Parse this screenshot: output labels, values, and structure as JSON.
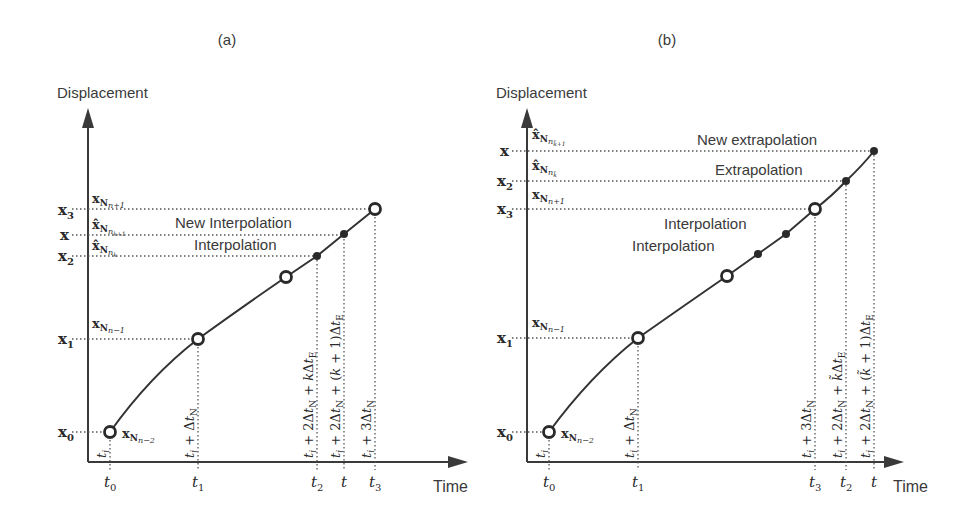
{
  "panels": [
    {
      "id": "a",
      "label": "(a)",
      "y_axis_label": "Displacement",
      "x_axis_label": "Time",
      "y_ticks": [
        {
          "label": "x3",
          "sub": "3",
          "y": 209
        },
        {
          "label": "x",
          "sub": "",
          "y": 235
        },
        {
          "label": "x2",
          "sub": "2",
          "y": 256
        },
        {
          "label": "x1",
          "sub": "1",
          "y": 339
        },
        {
          "label": "x0",
          "sub": "0",
          "y": 432
        }
      ],
      "point_labels": {
        "x_N_n+1": "xNn+1",
        "xhat_N_nk+1": "x̂Nnk+1",
        "xhat_N_nk": "x̂Nnk",
        "x_N_n-1": "xNn−1",
        "x_N_n-2": "xNn−2"
      },
      "annotations": [
        "New Interpolation",
        "Interpolation"
      ],
      "x_ticks": [
        "t0",
        "t1",
        "t2",
        "t",
        "t3"
      ],
      "vertical_labels": [
        "ti",
        "ti + ΔtN",
        "ti + 2ΔtN + kΔtE",
        "ti + 2ΔtN + (k + 1)ΔtE",
        "ti + 3ΔtN"
      ]
    },
    {
      "id": "b",
      "label": "(b)",
      "y_axis_label": "Displacement",
      "x_axis_label": "Time",
      "y_ticks": [
        {
          "label": "x",
          "sub": "",
          "y": 151
        },
        {
          "label": "x2",
          "sub": "2",
          "y": 181
        },
        {
          "label": "x3",
          "sub": "3",
          "y": 209
        },
        {
          "label": "x1",
          "sub": "1",
          "y": 338
        },
        {
          "label": "x0",
          "sub": "0",
          "y": 432
        }
      ],
      "point_labels": {
        "xhat_N_nk+1": "x̂Nnk̃+1",
        "xhat_N_nk": "x̂Nnk̃",
        "x_N_n+1": "xNn+1",
        "x_N_n-1": "xNn−1",
        "x_N_n-2": "xNn−2"
      },
      "annotations": [
        "New extrapolation",
        "Extrapolation",
        "Interpolation",
        "Interpolation"
      ],
      "x_ticks": [
        "t0",
        "t1",
        "t3",
        "t2",
        "t"
      ],
      "vertical_labels": [
        "ti",
        "ti + ΔtN",
        "ti + 3ΔtN",
        "ti + 2ΔtN + k̃ΔtE",
        "ti + 2ΔtN + (k̃ + 1)ΔtE"
      ]
    }
  ]
}
